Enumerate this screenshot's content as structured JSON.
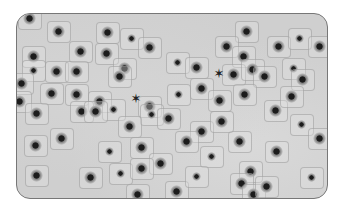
{
  "image": {
    "description": "Grayscale light micrograph of plant root tip cells in a rounded-rectangle frame; dark-stained nuclei in roughly rectangular cells, a couple of cells in mitosis",
    "frame": {
      "border_color": "#777777",
      "background": "#cfcfcf"
    },
    "nucleus_color": "#1c1c1c",
    "nuclei": [
      [
        28,
        17
      ],
      [
        57,
        30
      ],
      [
        106,
        31
      ],
      [
        130,
        37
      ],
      [
        79,
        50
      ],
      [
        105,
        52
      ],
      [
        148,
        46
      ],
      [
        32,
        55
      ],
      [
        32,
        69
      ],
      [
        55,
        70
      ],
      [
        75,
        70
      ],
      [
        123,
        67
      ],
      [
        118,
        75
      ],
      [
        176,
        61
      ],
      [
        195,
        66
      ],
      [
        20,
        82
      ],
      [
        50,
        92
      ],
      [
        75,
        93
      ],
      [
        177,
        93
      ],
      [
        200,
        87
      ],
      [
        18,
        100
      ],
      [
        98,
        100
      ],
      [
        148,
        105
      ],
      [
        112,
        108
      ],
      [
        245,
        30
      ],
      [
        225,
        45
      ],
      [
        242,
        55
      ],
      [
        277,
        45
      ],
      [
        298,
        37
      ],
      [
        318,
        45
      ],
      [
        232,
        73
      ],
      [
        251,
        68
      ],
      [
        263,
        75
      ],
      [
        292,
        67
      ],
      [
        301,
        78
      ],
      [
        218,
        99
      ],
      [
        243,
        93
      ],
      [
        274,
        109
      ],
      [
        300,
        123
      ],
      [
        238,
        140
      ],
      [
        318,
        137
      ],
      [
        249,
        170
      ],
      [
        240,
        182
      ],
      [
        310,
        176
      ],
      [
        252,
        193
      ],
      [
        35,
        112
      ],
      [
        80,
        110
      ],
      [
        94,
        110
      ],
      [
        150,
        113
      ],
      [
        167,
        117
      ],
      [
        128,
        125
      ],
      [
        60,
        137
      ],
      [
        34,
        144
      ],
      [
        108,
        150
      ],
      [
        140,
        146
      ],
      [
        159,
        162
      ],
      [
        35,
        174
      ],
      [
        89,
        176
      ],
      [
        119,
        172
      ],
      [
        140,
        167
      ],
      [
        175,
        190
      ],
      [
        136,
        193
      ],
      [
        200,
        130
      ],
      [
        210,
        155
      ],
      [
        185,
        140
      ],
      [
        275,
        150
      ],
      [
        290,
        95
      ],
      [
        265,
        185
      ],
      [
        195,
        175
      ],
      [
        220,
        120
      ]
    ],
    "mitotic_figures": [
      [
        135,
        98
      ],
      [
        218,
        73
      ]
    ],
    "mitotic_glyph": "✶"
  }
}
